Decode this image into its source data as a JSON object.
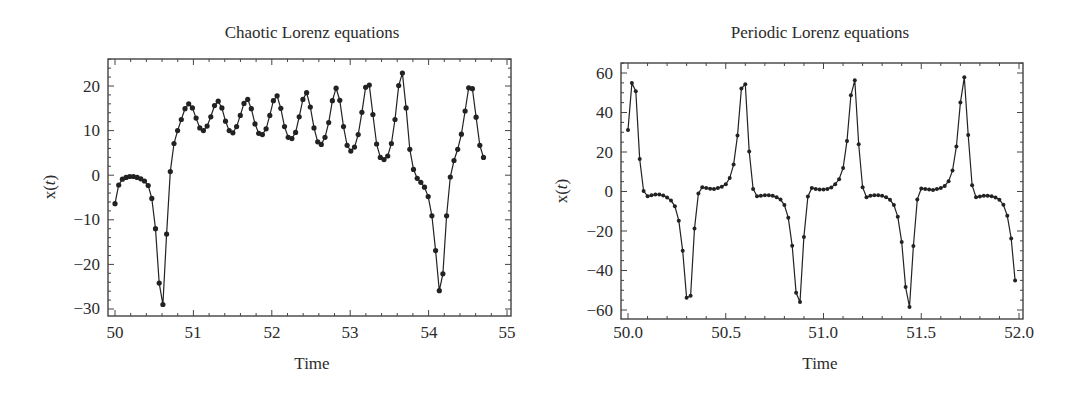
{
  "chart_data": [
    {
      "type": "line",
      "title": "Chaotic Lorenz equations",
      "xlabel": "Time",
      "ylabel": "x(t)",
      "xlim": [
        50,
        55
      ],
      "ylim": [
        -32,
        26
      ],
      "xticks": [
        50,
        51,
        52,
        53,
        54,
        55
      ],
      "yticks": [
        -30,
        -20,
        -10,
        0,
        10,
        20
      ],
      "grid": false,
      "legend": null,
      "markers": true,
      "series": [
        {
          "name": "x(t)",
          "x_start": 50.0,
          "dt": 0.047,
          "values": [
            -6.4,
            -2.2,
            -0.9,
            -0.5,
            -0.3,
            -0.3,
            -0.5,
            -0.8,
            -1.3,
            -2.3,
            -5.2,
            -12.0,
            -24.2,
            -29.0,
            -13.2,
            0.8,
            7.1,
            10.0,
            12.5,
            14.9,
            16.0,
            15.1,
            12.8,
            10.6,
            10.0,
            11.0,
            13.1,
            15.6,
            16.6,
            15.1,
            12.1,
            10.0,
            9.5,
            10.9,
            13.4,
            16.1,
            17.0,
            14.9,
            11.5,
            9.4,
            9.1,
            10.4,
            13.4,
            16.7,
            17.8,
            15.0,
            10.9,
            8.5,
            8.2,
            9.6,
            13.1,
            17.0,
            18.5,
            15.3,
            10.6,
            7.5,
            6.9,
            8.5,
            11.8,
            16.7,
            19.5,
            16.8,
            10.9,
            6.7,
            5.4,
            6.3,
            9.1,
            14.1,
            19.7,
            20.2,
            13.6,
            7.0,
            4.0,
            3.5,
            4.3,
            7.1,
            12.5,
            20.1,
            22.9,
            15.1,
            5.8,
            1.3,
            -0.7,
            -1.6,
            -2.7,
            -4.8,
            -9.1,
            -16.9,
            -25.9,
            -22.1,
            -9.1,
            -0.4,
            3.3,
            5.8,
            9.2,
            14.4,
            19.6,
            19.4,
            13.0,
            6.7,
            4.0
          ]
        }
      ]
    },
    {
      "type": "line",
      "title": "Periodic Lorenz equations",
      "xlabel": "Time",
      "ylabel": "x(t)",
      "xlim": [
        49.96,
        52.02
      ],
      "ylim": [
        -65,
        66
      ],
      "xticks": [
        50.0,
        50.5,
        51.0,
        51.5,
        52.0
      ],
      "yticks": [
        -60,
        -40,
        -20,
        0,
        20,
        40,
        60
      ],
      "grid": false,
      "legend": null,
      "markers": true,
      "series": [
        {
          "name": "x(t)",
          "x_start": 50.0,
          "dt": 0.02,
          "values": [
            31.2,
            54.9,
            50.8,
            16.4,
            0.2,
            -2.4,
            -1.9,
            -1.5,
            -1.5,
            -2.0,
            -3.0,
            -4.5,
            -7.5,
            -14.8,
            -30.0,
            -53.8,
            -52.8,
            -18.8,
            -1.0,
            2.2,
            1.7,
            1.4,
            1.2,
            1.7,
            2.4,
            3.7,
            6.8,
            13.6,
            28.3,
            52.1,
            54.3,
            20.3,
            1.3,
            -2.4,
            -2.2,
            -1.9,
            -1.9,
            -2.2,
            -2.9,
            -4.0,
            -6.9,
            -13.3,
            -27.5,
            -51.3,
            -56.0,
            -23.0,
            -2.5,
            1.8,
            1.3,
            1.0,
            1.0,
            1.3,
            2.1,
            3.7,
            6.2,
            11.9,
            25.6,
            48.7,
            56.3,
            23.9,
            2.2,
            -2.9,
            -2.2,
            -1.9,
            -1.9,
            -2.2,
            -2.9,
            -4.2,
            -6.9,
            -12.8,
            -25.5,
            -48.4,
            -58.5,
            -27.6,
            -4.0,
            1.5,
            1.3,
            1.0,
            0.8,
            1.2,
            1.7,
            2.8,
            5.2,
            10.6,
            22.8,
            45.0,
            57.8,
            28.6,
            3.2,
            -2.9,
            -2.5,
            -2.2,
            -2.2,
            -2.4,
            -3.0,
            -4.2,
            -6.7,
            -12.3,
            -23.8,
            -45.1
          ]
        }
      ]
    }
  ],
  "charts": [
    {
      "title": "Chaotic Lorenz equations",
      "xlabel": "Time",
      "ylabel_prefix": "x(",
      "ylabel_var": "t",
      "ylabel_suffix": ")",
      "xtick_labels": [
        "50",
        "51",
        "52",
        "53",
        "54",
        "55"
      ],
      "ytick_labels": [
        "20",
        "10",
        "0",
        "−10",
        "−20",
        "−30"
      ]
    },
    {
      "title": "Periodic Lorenz equations",
      "xlabel": "Time",
      "ylabel_prefix": "x(",
      "ylabel_var": "t",
      "ylabel_suffix": ")",
      "xtick_labels": [
        "50.0",
        "50.5",
        "51.0",
        "51.5",
        "52.0"
      ],
      "ytick_labels": [
        "60",
        "40",
        "20",
        "0",
        "−20",
        "−40",
        "−60"
      ]
    }
  ],
  "colors": {
    "line": "#222222",
    "frame": "#333333",
    "text": "#2b2b2b",
    "background": "#ffffff"
  }
}
